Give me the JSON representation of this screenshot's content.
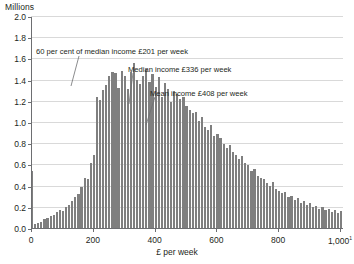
{
  "chart_data": {
    "type": "bar",
    "title": "",
    "subtitle": "",
    "xlabel": "£ per week",
    "ylabel": "Millions",
    "xlim": [
      0,
      1010
    ],
    "ylim": [
      0.0,
      2.0
    ],
    "grid": true,
    "legend": null,
    "bin_width": 10,
    "x_tick_labels": [
      "0",
      "200",
      "400",
      "600",
      "800",
      "1,000"
    ],
    "x_tick_values": [
      0,
      200,
      400,
      600,
      800,
      1000
    ],
    "x_last_tick_suffix": "1",
    "y_tick_labels": [
      "0.0",
      "0.2",
      "0.4",
      "0.6",
      "0.8",
      "1.0",
      "1.2",
      "1.4",
      "1.6",
      "1.8",
      "2.0"
    ],
    "y_tick_values": [
      0.0,
      0.2,
      0.4,
      0.6,
      0.8,
      1.0,
      1.2,
      1.4,
      1.6,
      1.8,
      2.0
    ],
    "bar_color": "#7f7f7f",
    "grid_color": "#d9d9d9",
    "axis_color": "#6d6e71",
    "x": [
      0,
      10,
      20,
      30,
      40,
      50,
      60,
      70,
      80,
      90,
      100,
      110,
      120,
      130,
      140,
      150,
      160,
      170,
      180,
      190,
      200,
      210,
      220,
      230,
      240,
      250,
      260,
      270,
      280,
      290,
      300,
      310,
      320,
      330,
      340,
      350,
      360,
      370,
      380,
      390,
      400,
      410,
      420,
      430,
      440,
      450,
      460,
      470,
      480,
      490,
      500,
      510,
      520,
      530,
      540,
      550,
      560,
      570,
      580,
      590,
      600,
      610,
      620,
      630,
      640,
      650,
      660,
      670,
      680,
      690,
      700,
      710,
      720,
      730,
      740,
      750,
      760,
      770,
      780,
      790,
      800,
      810,
      820,
      830,
      840,
      850,
      860,
      870,
      880,
      890,
      900,
      910,
      920,
      930,
      940,
      950,
      960,
      970,
      980,
      990,
      1000
    ],
    "values": [
      0.55,
      0.05,
      0.06,
      0.07,
      0.09,
      0.1,
      0.12,
      0.13,
      0.16,
      0.18,
      0.17,
      0.21,
      0.23,
      0.26,
      0.3,
      0.33,
      0.4,
      0.48,
      0.47,
      0.62,
      0.7,
      1.25,
      1.22,
      1.31,
      1.36,
      1.44,
      1.48,
      1.47,
      1.33,
      1.49,
      1.44,
      1.32,
      1.48,
      1.57,
      1.41,
      1.37,
      1.44,
      1.51,
      1.39,
      1.46,
      1.34,
      1.43,
      1.25,
      1.38,
      1.32,
      1.2,
      1.3,
      1.27,
      1.23,
      1.25,
      1.16,
      1.12,
      1.09,
      1.1,
      1.02,
      1.06,
      0.96,
      0.93,
      0.98,
      0.88,
      0.9,
      0.86,
      0.8,
      0.76,
      0.79,
      0.73,
      0.7,
      0.66,
      0.69,
      0.62,
      0.6,
      0.55,
      0.57,
      0.5,
      0.48,
      0.47,
      0.43,
      0.41,
      0.44,
      0.38,
      0.36,
      0.34,
      0.35,
      0.3,
      0.31,
      0.27,
      0.29,
      0.25,
      0.26,
      0.23,
      0.25,
      0.21,
      0.22,
      0.19,
      0.21,
      0.18,
      0.19,
      0.16,
      0.18,
      0.15,
      0.17
    ],
    "annotations": [
      {
        "id": "low-income-threshold",
        "text": "60 per cent of median income £201 per week",
        "value": 201,
        "label_x": 36,
        "label_y": 48,
        "leader": {
          "x1": 79,
          "y1": 56,
          "x2": 71,
          "y2": 86
        }
      },
      {
        "id": "median-income",
        "text": "Median income £336 per week",
        "value": 336,
        "label_x": 128,
        "label_y": 66,
        "leader": {
          "x1": 133,
          "y1": 73,
          "x2": 129,
          "y2": 104
        }
      },
      {
        "id": "mean-income",
        "text": "Mean income £408 per week",
        "value": 408,
        "label_x": 150,
        "label_y": 90,
        "leader": {
          "x1": 155,
          "y1": 97,
          "x2": 146,
          "y2": 125
        }
      }
    ]
  }
}
